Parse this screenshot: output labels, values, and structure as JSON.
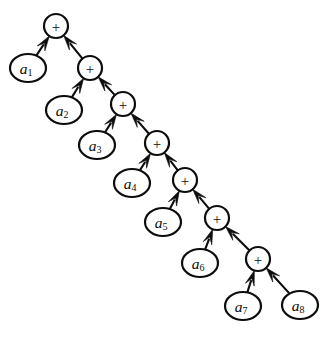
{
  "diagram": {
    "background_color": "#ffffff",
    "stroke_color": "#0d0d0d",
    "node_fill_color": "#ffffff",
    "width": 331,
    "height": 339,
    "edge_direction": "child-to-parent",
    "arrowhead_style": "filled-solid",
    "operator_symbol": "+",
    "operator_nodes": [
      {
        "id": "op1",
        "label": "+",
        "shape": "circle",
        "cx": 56,
        "cy": 26,
        "r": 12,
        "depth": 0
      },
      {
        "id": "op2",
        "label": "+",
        "shape": "circle",
        "cx": 90,
        "cy": 68,
        "r": 12,
        "depth": 1
      },
      {
        "id": "op3",
        "label": "+",
        "shape": "circle",
        "cx": 123,
        "cy": 104,
        "r": 12,
        "depth": 2
      },
      {
        "id": "op4",
        "label": "+",
        "shape": "circle",
        "cx": 157,
        "cy": 143,
        "r": 12,
        "depth": 3
      },
      {
        "id": "op5",
        "label": "+",
        "shape": "circle",
        "cx": 185,
        "cy": 180,
        "r": 12,
        "depth": 4
      },
      {
        "id": "op6",
        "label": "+",
        "shape": "circle",
        "cx": 217,
        "cy": 218,
        "r": 12,
        "depth": 5
      },
      {
        "id": "op7",
        "label": "+",
        "shape": "circle",
        "cx": 258,
        "cy": 259,
        "r": 12,
        "depth": 6
      }
    ],
    "leaf_nodes": [
      {
        "id": "a1",
        "base": "a",
        "sub": "1",
        "shape": "ellipse",
        "cx": 28,
        "cy": 68,
        "rx": 18,
        "ry": 14
      },
      {
        "id": "a2",
        "base": "a",
        "sub": "2",
        "shape": "ellipse",
        "cx": 64,
        "cy": 110,
        "rx": 18,
        "ry": 14
      },
      {
        "id": "a3",
        "base": "a",
        "sub": "3",
        "shape": "ellipse",
        "cx": 97,
        "cy": 145,
        "rx": 18,
        "ry": 14
      },
      {
        "id": "a4",
        "base": "a",
        "sub": "4",
        "shape": "ellipse",
        "cx": 132,
        "cy": 183,
        "rx": 18,
        "ry": 14
      },
      {
        "id": "a5",
        "base": "a",
        "sub": "5",
        "shape": "ellipse",
        "cx": 163,
        "cy": 222,
        "rx": 18,
        "ry": 14
      },
      {
        "id": "a6",
        "base": "a",
        "sub": "6",
        "shape": "ellipse",
        "cx": 200,
        "cy": 263,
        "rx": 18,
        "ry": 14
      },
      {
        "id": "a7",
        "base": "a",
        "sub": "7",
        "shape": "ellipse",
        "cx": 243,
        "cy": 306,
        "rx": 18,
        "ry": 14
      },
      {
        "id": "a8",
        "base": "a",
        "sub": "8",
        "shape": "ellipse",
        "cx": 300,
        "cy": 305,
        "rx": 18,
        "ry": 14
      }
    ],
    "edges": [
      {
        "from": "a1",
        "to": "op1"
      },
      {
        "from": "op2",
        "to": "op1"
      },
      {
        "from": "a2",
        "to": "op2"
      },
      {
        "from": "op3",
        "to": "op2"
      },
      {
        "from": "a3",
        "to": "op3"
      },
      {
        "from": "op4",
        "to": "op3"
      },
      {
        "from": "a4",
        "to": "op4"
      },
      {
        "from": "op5",
        "to": "op4"
      },
      {
        "from": "a5",
        "to": "op5"
      },
      {
        "from": "op6",
        "to": "op5"
      },
      {
        "from": "a6",
        "to": "op6"
      },
      {
        "from": "op7",
        "to": "op6"
      },
      {
        "from": "a7",
        "to": "op7"
      },
      {
        "from": "a8",
        "to": "op7"
      }
    ]
  }
}
